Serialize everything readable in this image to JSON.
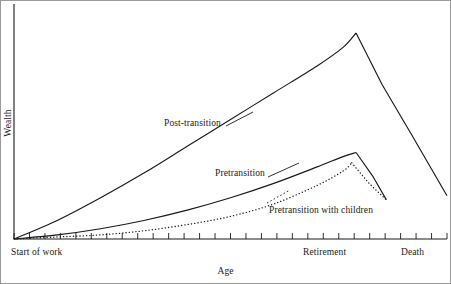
{
  "chart_data": {
    "type": "line",
    "title": "",
    "xlabel": "Age",
    "ylabel": "Wealth",
    "grid": false,
    "legend_position": "inline-annotations",
    "xlim": [
      0,
      100
    ],
    "ylim": [
      0,
      100
    ],
    "xtick_labels": [
      "Start of work",
      "Retirement",
      "Death"
    ],
    "xtick_positions": [
      0,
      79,
      100
    ],
    "ytick_labels": [],
    "annotations": [
      {
        "text": "Post-transition",
        "x": 38,
        "y": 55
      },
      {
        "text": "Pretransition",
        "x": 50,
        "y": 32
      },
      {
        "text": "Pretransition with children",
        "x": 63,
        "y": 14
      }
    ],
    "series": [
      {
        "name": "Post-transition",
        "style": "solid",
        "color": "#1a1a1a",
        "points": [
          {
            "x": 0,
            "y": 0
          },
          {
            "x": 10,
            "y": 9
          },
          {
            "x": 20,
            "y": 20
          },
          {
            "x": 30,
            "y": 32
          },
          {
            "x": 40,
            "y": 45
          },
          {
            "x": 50,
            "y": 58
          },
          {
            "x": 60,
            "y": 71
          },
          {
            "x": 70,
            "y": 84
          },
          {
            "x": 76,
            "y": 93
          },
          {
            "x": 79,
            "y": 100
          },
          {
            "x": 85,
            "y": 75
          },
          {
            "x": 92,
            "y": 50
          },
          {
            "x": 100,
            "y": 21
          }
        ]
      },
      {
        "name": "Pretransition",
        "style": "solid",
        "color": "#1a1a1a",
        "points": [
          {
            "x": 0,
            "y": 0
          },
          {
            "x": 10,
            "y": 2
          },
          {
            "x": 20,
            "y": 5
          },
          {
            "x": 30,
            "y": 9
          },
          {
            "x": 40,
            "y": 14
          },
          {
            "x": 50,
            "y": 20
          },
          {
            "x": 60,
            "y": 27
          },
          {
            "x": 70,
            "y": 35
          },
          {
            "x": 76,
            "y": 40
          },
          {
            "x": 79,
            "y": 42
          },
          {
            "x": 83,
            "y": 30
          },
          {
            "x": 86,
            "y": 19
          }
        ]
      },
      {
        "name": "Pretransition with children",
        "style": "dotted",
        "color": "#1a1a1a",
        "points": [
          {
            "x": 0,
            "y": 0
          },
          {
            "x": 10,
            "y": 1
          },
          {
            "x": 20,
            "y": 2
          },
          {
            "x": 30,
            "y": 4
          },
          {
            "x": 40,
            "y": 7
          },
          {
            "x": 50,
            "y": 11
          },
          {
            "x": 60,
            "y": 17
          },
          {
            "x": 70,
            "y": 26
          },
          {
            "x": 76,
            "y": 33
          },
          {
            "x": 78,
            "y": 37
          },
          {
            "x": 82,
            "y": 27
          },
          {
            "x": 86,
            "y": 19
          }
        ]
      }
    ],
    "minor_tick_count": 28
  }
}
